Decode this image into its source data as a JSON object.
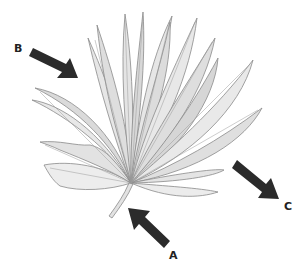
{
  "figure": {
    "labels": {
      "a": "A",
      "b": "B",
      "c": "C"
    },
    "colors": {
      "leaf_fill_light": "#ececec",
      "leaf_fill_mid": "#dcdcdc",
      "leaf_stroke": "#8a8a8a",
      "arrow": "#2b2b2b",
      "label": "#222222",
      "background": "#ffffff"
    }
  }
}
